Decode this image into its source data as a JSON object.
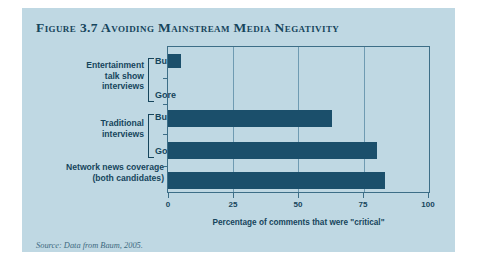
{
  "figure": {
    "title": "Figure 3.7 Avoiding Mainstream Media Negativity",
    "source": "Source: Data from Baum, 2005.",
    "panel_color": "#bfd8e3",
    "bar_color": "#1b4f6b",
    "frame_color": "#3d6e87",
    "text_color": "#16455c"
  },
  "chart_data": {
    "type": "bar",
    "orientation": "horizontal",
    "title": "Figure 3.7 Avoiding Mainstream Media Negativity",
    "xlabel": "Percentage of comments that were \"critical\"",
    "ylabel": "",
    "xlim": [
      0,
      100
    ],
    "xticks": [
      0,
      25,
      50,
      75,
      100
    ],
    "xtick_labels": [
      "0",
      "25",
      "50",
      "75",
      "100"
    ],
    "grid": true,
    "legend": "none",
    "categories": [
      "Entertainment talk show interviews — Bush",
      "Entertainment talk show interviews — Gore",
      "Traditional interviews — Bush",
      "Traditional interviews — Gore",
      "Network news coverage (both candidates)"
    ],
    "values": [
      5,
      0,
      63,
      80,
      83
    ],
    "groups": [
      {
        "label": "Entertainment talk show interviews",
        "label_lines": [
          "Entertainment",
          "talk show",
          "interviews"
        ],
        "bracket": true,
        "items": [
          {
            "name": "Bush",
            "value": 5
          },
          {
            "name": "Gore",
            "value": 0
          }
        ]
      },
      {
        "label": "Traditional interviews",
        "label_lines": [
          "Traditional",
          "interviews"
        ],
        "bracket": true,
        "items": [
          {
            "name": "Bush",
            "value": 63
          },
          {
            "name": "Gore",
            "value": 80
          }
        ]
      },
      {
        "label": "Network news coverage (both candidates)",
        "label_lines": [
          "Network news coverage",
          "(both candidates)"
        ],
        "bracket": false,
        "items": [
          {
            "name": "",
            "value": 83
          }
        ]
      }
    ]
  },
  "axis": {
    "tick_0": "0",
    "tick_25": "25",
    "tick_50": "50",
    "tick_75": "75",
    "tick_100": "100",
    "title": "Percentage of comments that were \"critical\""
  },
  "labels": {
    "group1_line1": "Entertainment",
    "group1_line2": "talk show",
    "group1_line3": "interviews",
    "group1_item1": "Bush",
    "group1_item2": "Gore",
    "group2_line1": "Traditional",
    "group2_line2": "interviews",
    "group2_item1": "Bush",
    "group2_item2": "Gore",
    "group3_line1": "Network news coverage",
    "group3_line2": "(both candidates)"
  }
}
